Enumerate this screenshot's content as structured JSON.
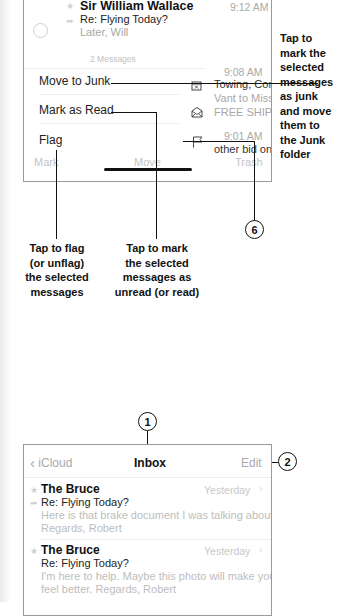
{
  "top_screen": {
    "message": {
      "sender": "Sir William Wallace",
      "time": "9:12 AM",
      "subject": "Re: Flying Today?",
      "preview": "Later, Will"
    },
    "message_count": "2 Messages",
    "background_items": [
      {
        "time": "9:08 AM",
        "line1": "Towing, Conv...",
        "line2": "Vant to Miss",
        "line3": "FREE SHIPPI..."
      },
      {
        "time": "9:01 AM",
        "line1": "other bid on..."
      }
    ],
    "actions": [
      {
        "label": "Move to Junk",
        "icon": "junk-tray-icon"
      },
      {
        "label": "Mark as Read",
        "icon": "envelope-open-icon"
      },
      {
        "label": "Flag",
        "icon": "flag-icon"
      }
    ],
    "toolbar": {
      "mark": "Mark",
      "move": "Move",
      "trash": "Trash"
    }
  },
  "callouts": {
    "junk": "Tap to mark the selected messages as junk and move them to the Junk folder",
    "junk_lines": [
      "Tap to",
      "mark the",
      "selected",
      "messages",
      "as junk",
      "and move",
      "them to",
      "the Junk",
      "folder"
    ],
    "flag_lines": [
      "Tap to flag",
      "(or unflag)",
      "the selected",
      "messages"
    ],
    "mark_lines": [
      "Tap to mark",
      "the selected",
      "messages as",
      "unread (or read)"
    ],
    "num_6": "6",
    "num_1": "1",
    "num_2": "2"
  },
  "bottom_screen": {
    "nav": {
      "back_label": "iCloud",
      "title": "Inbox",
      "edit_label": "Edit"
    },
    "messages": [
      {
        "sender": "The Bruce",
        "time": "Yesterday",
        "subject": "Re:  Flying Today?",
        "preview_line1": "Here is that brake document I was talking about.",
        "preview_line2": "Regards, Robert"
      },
      {
        "sender": "The Bruce",
        "time": "Yesterday",
        "subject": "Re:  Flying Today?",
        "preview_line1": "I'm here to help. Maybe this photo will make you",
        "preview_line2": "feel better. Regards, Robert"
      }
    ]
  }
}
